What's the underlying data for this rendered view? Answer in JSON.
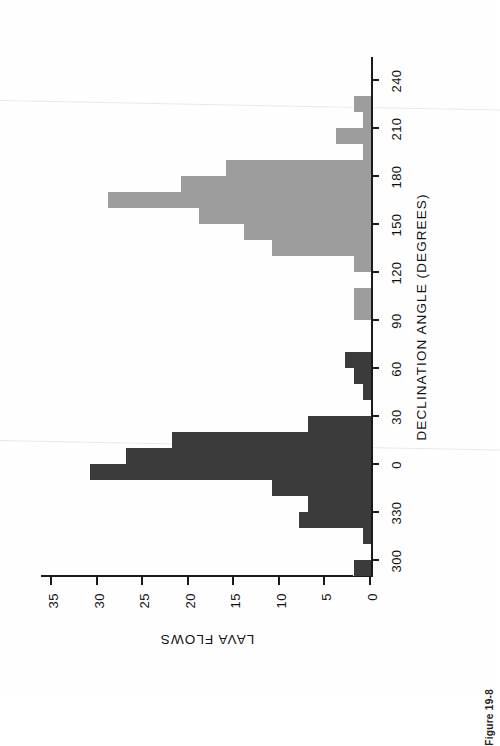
{
  "figure": {
    "caption": "Figure 19-8"
  },
  "chart_data": {
    "type": "bar",
    "title": "",
    "xlabel": "DECLINATION ANGLE (DEGREES)",
    "ylabel": "LAVA FLOWS",
    "orientation": "horizontal-bars-rotated-page",
    "grid": false,
    "legend": null,
    "xlim": [
      295,
      285
    ],
    "ylim": [
      0,
      36
    ],
    "xticks": [
      300,
      330,
      0,
      30,
      60,
      90,
      120,
      150,
      180,
      210,
      240,
      270
    ],
    "xtick_labels": [
      "300",
      "330",
      "0",
      "30",
      "60",
      "90",
      "120",
      "150",
      "180",
      "210",
      "240",
      "270"
    ],
    "yticks": [
      0,
      5,
      10,
      15,
      20,
      25,
      30,
      35
    ],
    "ytick_labels": [
      "0",
      "5",
      "10",
      "15",
      "20",
      "25",
      "30",
      "35"
    ],
    "bin_width_degrees": 10,
    "colors": {
      "normal_polarity": "#3b3b3b",
      "reversed_polarity": "#9d9d9d",
      "axis": "#1a1a1a",
      "background": "#fefefe"
    },
    "categories": [
      "295",
      "305",
      "315",
      "325",
      "335",
      "345",
      "355",
      "5",
      "15",
      "25",
      "35",
      "45",
      "55",
      "65",
      "75",
      "85",
      "95",
      "105",
      "115",
      "125",
      "135",
      "145",
      "155",
      "165",
      "175",
      "185",
      "195",
      "205",
      "215",
      "225",
      "235",
      "245"
    ],
    "bars": [
      {
        "center": 300,
        "value": 2,
        "group": "dark"
      },
      {
        "center": 310,
        "value": 0,
        "group": "dark"
      },
      {
        "center": 320,
        "value": 1,
        "group": "dark"
      },
      {
        "center": 330,
        "value": 8,
        "group": "dark"
      },
      {
        "center": 340,
        "value": 7,
        "group": "dark"
      },
      {
        "center": 350,
        "value": 11,
        "group": "dark"
      },
      {
        "center": 0,
        "value": 31,
        "group": "dark"
      },
      {
        "center": 10,
        "value": 27,
        "group": "dark"
      },
      {
        "center": 20,
        "value": 22,
        "group": "dark"
      },
      {
        "center": 30,
        "value": 7,
        "group": "dark"
      },
      {
        "center": 40,
        "value": 0,
        "group": "dark"
      },
      {
        "center": 50,
        "value": 1,
        "group": "dark"
      },
      {
        "center": 60,
        "value": 2,
        "group": "dark"
      },
      {
        "center": 70,
        "value": 3,
        "group": "dark"
      },
      {
        "center": 80,
        "value": 0,
        "group": "dark"
      },
      {
        "center": 90,
        "value": 0,
        "group": "dark"
      },
      {
        "center": 100,
        "value": 2,
        "group": "light"
      },
      {
        "center": 110,
        "value": 2,
        "group": "light"
      },
      {
        "center": 120,
        "value": 0,
        "group": "light"
      },
      {
        "center": 130,
        "value": 2,
        "group": "light"
      },
      {
        "center": 140,
        "value": 11,
        "group": "light"
      },
      {
        "center": 150,
        "value": 14,
        "group": "light"
      },
      {
        "center": 160,
        "value": 19,
        "group": "light"
      },
      {
        "center": 170,
        "value": 29,
        "group": "light"
      },
      {
        "center": 180,
        "value": 21,
        "group": "light"
      },
      {
        "center": 190,
        "value": 16,
        "group": "light"
      },
      {
        "center": 200,
        "value": 1,
        "group": "light"
      },
      {
        "center": 210,
        "value": 4,
        "group": "light"
      },
      {
        "center": 220,
        "value": 1,
        "group": "light"
      },
      {
        "center": 230,
        "value": 2,
        "group": "light"
      },
      {
        "center": 240,
        "value": 0,
        "group": "light"
      },
      {
        "center": 250,
        "value": 0,
        "group": "light"
      }
    ]
  }
}
